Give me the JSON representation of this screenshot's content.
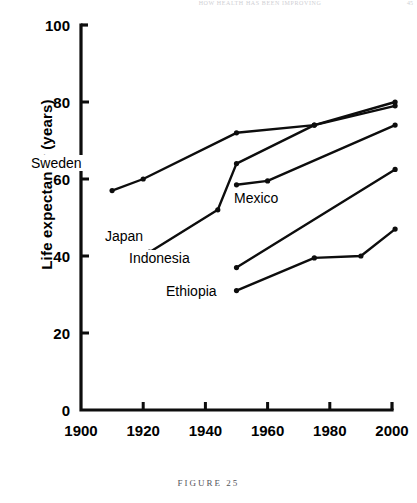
{
  "page": {
    "running_head": "HOW HEALTH HAS BEEN IMPROVING",
    "folio": "45",
    "figure_caption": "FIGURE 25"
  },
  "chart_data": {
    "type": "line",
    "title": "",
    "xlabel": "Year",
    "ylabel": "Life expectancy (years)",
    "xlim": [
      1900,
      2000
    ],
    "ylim": [
      0,
      100
    ],
    "xticks": [
      1900,
      1920,
      1940,
      1960,
      1980,
      2000
    ],
    "yticks": [
      0,
      20,
      40,
      60,
      80,
      100
    ],
    "grid": false,
    "legend": "inline-labels",
    "line_color": "#0d0d0d",
    "series": [
      {
        "name": "Sweden",
        "label": "Sweden",
        "x": [
          1910,
          1920,
          1950,
          1975,
          2001
        ],
        "y": [
          57,
          60,
          72,
          74,
          80
        ]
      },
      {
        "name": "Japan",
        "label": "Japan",
        "x": [
          1922,
          1944,
          1950,
          1975,
          2001
        ],
        "y": [
          41,
          52,
          64,
          74,
          79
        ]
      },
      {
        "name": "Mexico",
        "label": "Mexico",
        "x": [
          1950,
          1960,
          2001
        ],
        "y": [
          58.5,
          59.5,
          74
        ]
      },
      {
        "name": "Indonesia",
        "label": "Indonesia",
        "x": [
          1950,
          2001
        ],
        "y": [
          37,
          62.5
        ]
      },
      {
        "name": "Ethiopia",
        "label": "Ethiopia",
        "x": [
          1950,
          1975,
          1990,
          2001
        ],
        "y": [
          31,
          39.5,
          40,
          47
        ]
      }
    ]
  }
}
